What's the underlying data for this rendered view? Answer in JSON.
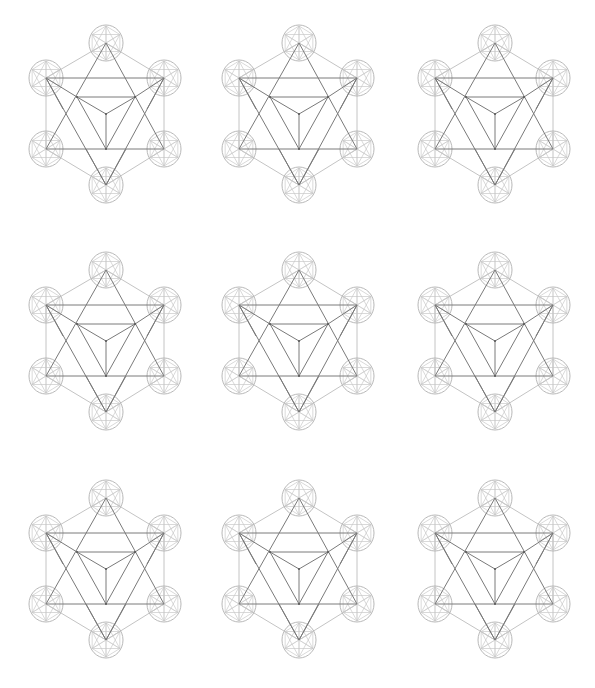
{
  "page": {
    "background": "#ffffff"
  },
  "style": {
    "dark_line": "#7a7a7a",
    "light_line": "#c4c4c4",
    "circle_line": "#b0b0b0",
    "inner_pattern_line": "#c8c8c8"
  },
  "grid": {
    "columns_cx": [
      106,
      299,
      495
    ],
    "rows_top_y": [
      43,
      270,
      498
    ]
  },
  "figure": {
    "vertices": {
      "T": [
        0,
        0
      ],
      "UL": [
        -60,
        35
      ],
      "UR": [
        58,
        35
      ],
      "LL": [
        -60,
        106
      ],
      "LR": [
        58,
        106
      ],
      "B": [
        0,
        142
      ],
      "IL": [
        -29,
        54
      ],
      "IR": [
        29,
        54
      ],
      "C": [
        0,
        71
      ],
      "IB": [
        0,
        106
      ]
    },
    "light_edges": [
      [
        "T",
        "UL"
      ],
      [
        "T",
        "UR"
      ],
      [
        "UL",
        "LL"
      ],
      [
        "UR",
        "LR"
      ],
      [
        "LL",
        "B"
      ],
      [
        "LR",
        "B"
      ]
    ],
    "dark_edges": [
      [
        "T",
        "LL"
      ],
      [
        "T",
        "LR"
      ],
      [
        "LL",
        "LR"
      ],
      [
        "UL",
        "UR"
      ],
      [
        "UL",
        "B"
      ],
      [
        "UR",
        "B"
      ],
      [
        "IL",
        "IR"
      ],
      [
        "IL",
        "C"
      ],
      [
        "IR",
        "C"
      ],
      [
        "C",
        "IB"
      ],
      [
        "IL",
        "IB"
      ],
      [
        "IR",
        "IB"
      ],
      [
        "UL",
        "IL"
      ],
      [
        "UR",
        "IR"
      ]
    ],
    "dark_segments": [
      [
        [
          -60,
          35
        ],
        [
          -43,
          66
        ]
      ],
      [
        [
          58,
          35
        ],
        [
          41,
          66
        ]
      ],
      [
        [
          0,
          142
        ],
        [
          -20,
          106
        ]
      ],
      [
        [
          0,
          142
        ],
        [
          20,
          106
        ]
      ]
    ],
    "circle_nodes": [
      "T",
      "UL",
      "UR",
      "LL",
      "LR",
      "B"
    ],
    "circle_rx": 17,
    "circle_ry": 18
  },
  "figures": [
    {
      "id": "r1c1"
    },
    {
      "id": "r1c2"
    },
    {
      "id": "r1c3"
    },
    {
      "id": "r2c1"
    },
    {
      "id": "r2c2"
    },
    {
      "id": "r2c3"
    },
    {
      "id": "r3c1"
    },
    {
      "id": "r3c2"
    },
    {
      "id": "r3c3"
    }
  ]
}
